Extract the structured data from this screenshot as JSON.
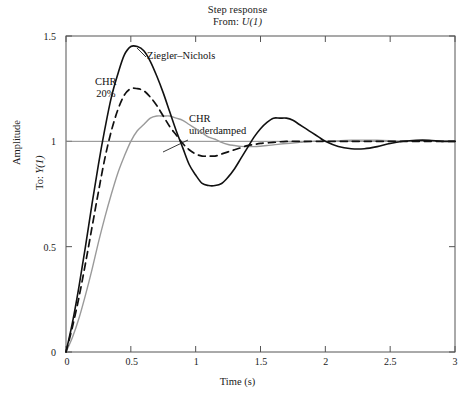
{
  "chart_data": {
    "type": "line",
    "title": "Step response",
    "subtitle": "From: U(1)",
    "subtitle_prefix": "From: ",
    "subtitle_signal": "U(1)",
    "xlabel": "Time (s)",
    "ylabel": "Amplitude",
    "ylabel_inner_prefix": "To: ",
    "ylabel_inner_signal": "Y(1)",
    "xlim": [
      0,
      3
    ],
    "ylim": [
      0,
      1.5
    ],
    "xticks": [
      0,
      0.5,
      1,
      1.5,
      2,
      2.5,
      3
    ],
    "xtick_labels": [
      "0",
      "0.5",
      "1",
      "1.5",
      "2",
      "2.5",
      "3"
    ],
    "yticks": [
      0,
      0.5,
      1,
      1.5
    ],
    "ytick_labels": [
      "0",
      "0.5",
      "1",
      "1.5"
    ],
    "grid": false,
    "reference_line": 1,
    "legend": "inline-annotations",
    "series": [
      {
        "name": "Ziegler-Nichols",
        "style": "solid",
        "color": "#111111",
        "peak": 1.45,
        "peak_time": 0.49,
        "trough": 0.79,
        "trough_time": 1.07,
        "second_peak": 1.11,
        "second_peak_time": 1.59,
        "x": [
          0,
          0.05,
          0.1,
          0.15,
          0.2,
          0.25,
          0.3,
          0.35,
          0.4,
          0.45,
          0.5,
          0.55,
          0.6,
          0.65,
          0.7,
          0.75,
          0.8,
          0.85,
          0.9,
          0.95,
          1.0,
          1.05,
          1.1,
          1.15,
          1.2,
          1.25,
          1.3,
          1.35,
          1.4,
          1.45,
          1.5,
          1.55,
          1.6,
          1.65,
          1.7,
          1.75,
          1.8,
          1.85,
          1.9,
          1.95,
          2.0,
          2.1,
          2.2,
          2.3,
          2.4,
          2.5,
          2.6,
          2.7,
          2.8,
          2.9,
          3.0
        ],
        "y": [
          0,
          0.14,
          0.31,
          0.5,
          0.7,
          0.89,
          1.06,
          1.21,
          1.32,
          1.41,
          1.45,
          1.45,
          1.43,
          1.38,
          1.31,
          1.23,
          1.14,
          1.05,
          0.97,
          0.89,
          0.84,
          0.8,
          0.79,
          0.79,
          0.8,
          0.83,
          0.87,
          0.92,
          0.97,
          1.02,
          1.06,
          1.09,
          1.11,
          1.11,
          1.11,
          1.1,
          1.08,
          1.06,
          1.04,
          1.02,
          1.0,
          0.975,
          0.965,
          0.965,
          0.975,
          0.99,
          1.0,
          1.005,
          1.005,
          1.0,
          1.0
        ]
      },
      {
        "name": "CHR 20%",
        "label_line1": "CHR",
        "label_line2": "20%",
        "style": "dashed",
        "color": "#111111",
        "peak": 1.25,
        "peak_time": 0.53,
        "trough": 0.93,
        "trough_time": 1.15,
        "x": [
          0,
          0.05,
          0.1,
          0.15,
          0.2,
          0.25,
          0.3,
          0.35,
          0.4,
          0.45,
          0.5,
          0.55,
          0.6,
          0.65,
          0.7,
          0.75,
          0.8,
          0.85,
          0.9,
          0.95,
          1.0,
          1.05,
          1.1,
          1.15,
          1.2,
          1.25,
          1.3,
          1.35,
          1.4,
          1.45,
          1.5,
          1.6,
          1.7,
          1.8,
          1.9,
          2.0,
          2.2,
          2.4,
          2.6,
          2.8,
          3.0
        ],
        "y": [
          0,
          0.12,
          0.26,
          0.42,
          0.59,
          0.76,
          0.92,
          1.05,
          1.15,
          1.22,
          1.25,
          1.25,
          1.24,
          1.21,
          1.17,
          1.12,
          1.07,
          1.03,
          0.99,
          0.96,
          0.94,
          0.93,
          0.93,
          0.93,
          0.94,
          0.95,
          0.96,
          0.97,
          0.98,
          0.985,
          0.99,
          0.995,
          1.0,
          1.0,
          1.0,
          1.0,
          1.0,
          1.0,
          1.0,
          1.0,
          1.0
        ]
      },
      {
        "name": "CHR underdamped",
        "label_line1": "CHR",
        "label_line2": "underdamped",
        "style": "solid",
        "color": "#9a9a9a",
        "peak": 1.12,
        "peak_time": 0.8,
        "trough": 0.975,
        "trough_time": 1.45,
        "x": [
          0,
          0.05,
          0.1,
          0.15,
          0.2,
          0.25,
          0.3,
          0.35,
          0.4,
          0.45,
          0.5,
          0.55,
          0.6,
          0.65,
          0.7,
          0.75,
          0.8,
          0.85,
          0.9,
          0.95,
          1.0,
          1.05,
          1.1,
          1.15,
          1.2,
          1.25,
          1.3,
          1.35,
          1.4,
          1.45,
          1.5,
          1.55,
          1.6,
          1.7,
          1.8,
          1.9,
          2.0,
          2.2,
          2.4,
          2.6,
          2.8,
          3.0
        ],
        "y": [
          0,
          0.07,
          0.16,
          0.27,
          0.39,
          0.52,
          0.64,
          0.75,
          0.85,
          0.93,
          1.0,
          1.05,
          1.08,
          1.11,
          1.12,
          1.12,
          1.12,
          1.11,
          1.1,
          1.08,
          1.06,
          1.04,
          1.02,
          1.01,
          0.995,
          0.985,
          0.98,
          0.976,
          0.975,
          0.975,
          0.977,
          0.98,
          0.983,
          0.99,
          0.995,
          1.0,
          1.0,
          1.005,
          1.005,
          1.0,
          1.0,
          1.0
        ]
      }
    ]
  },
  "annotations": [
    {
      "id": "ziegler-nichols",
      "text": "Ziegler–Nichols"
    },
    {
      "id": "chr-20",
      "line1": "CHR",
      "line2": "20%"
    },
    {
      "id": "chr-underdamped",
      "line1": "CHR",
      "line2": "underdamped"
    }
  ]
}
